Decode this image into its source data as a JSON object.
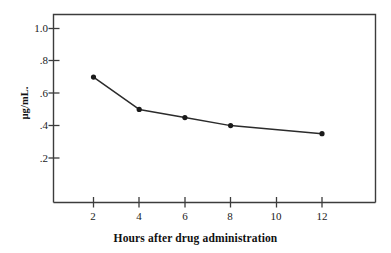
{
  "chart_data": {
    "type": "line",
    "title": "",
    "xlabel": "Hours after drug administration",
    "ylabel": "µg/mL.",
    "x": [
      2,
      4,
      6,
      8,
      12
    ],
    "values": [
      0.7,
      0.5,
      0.45,
      0.4,
      0.35
    ],
    "series": [
      {
        "name": "Plasma concentration",
        "x": [
          2,
          4,
          6,
          8,
          12
        ],
        "values": [
          0.7,
          0.5,
          0.45,
          0.4,
          0.35
        ]
      }
    ],
    "xlim": [
      0,
      14
    ],
    "ylim": [
      0,
      1.1
    ],
    "xticks": [
      2,
      4,
      6,
      8,
      10,
      12
    ],
    "xtick_labels": [
      "2",
      "4",
      "6",
      "8",
      "10",
      "12"
    ],
    "yticks": [
      0.2,
      0.4,
      0.6,
      0.8,
      1.0
    ],
    "ytick_labels": [
      ".2",
      ".4",
      ".6",
      ".8",
      "1.0"
    ],
    "grid": false,
    "legend": "none",
    "marker": "circle",
    "line_color": "#2b2b2b",
    "marker_color": "#1a1a1a",
    "axis_color": "#3c3c3c",
    "background_color": "#ffffff"
  },
  "axes": {
    "y_title": "µg/mL.",
    "x_title": "Hours after drug administration",
    "y_tick_labels": [
      "1.0",
      ".8",
      ".6",
      ".4",
      ".2"
    ],
    "x_tick_labels": [
      "2",
      "4",
      "6",
      "8",
      "10",
      "12"
    ]
  }
}
